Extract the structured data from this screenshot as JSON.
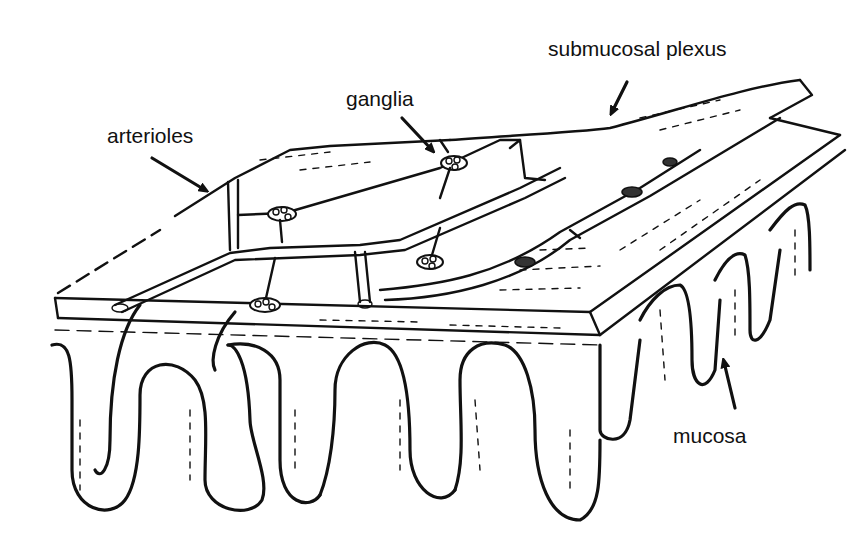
{
  "figure": {
    "style": "black-and-white line drawing",
    "ink_color": "#111111",
    "background_color": "#ffffff"
  },
  "labels": {
    "submucosal_plexus": "submucosal plexus",
    "ganglia": "ganglia",
    "arterioles": "arterioles",
    "mucosa": "mucosa"
  },
  "arrows": [
    {
      "label": "submucosal plexus",
      "direction": "down-left"
    },
    {
      "label": "ganglia",
      "direction": "down-right"
    },
    {
      "label": "arterioles",
      "direction": "down-right"
    },
    {
      "label": "mucosa",
      "direction": "up"
    }
  ]
}
